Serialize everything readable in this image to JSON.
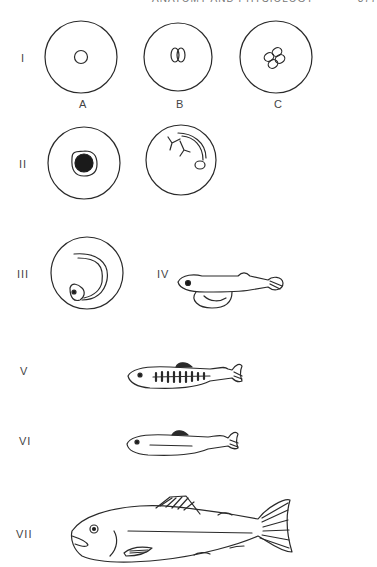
{
  "header": {
    "running_head": "ANATOMY AND PHYSIOLOGY",
    "page_number": "377"
  },
  "figure": {
    "stages": [
      {
        "label": "I",
        "description": "Cleavage stages of egg",
        "panels": [
          "A",
          "B",
          "C"
        ]
      },
      {
        "label": "II",
        "description": "Egg with blastoderm; egg with developing embryo and blood vessels"
      },
      {
        "label": "III",
        "description": "Embryo coiled within egg (eyed egg)"
      },
      {
        "label": "IV",
        "description": "Alevin (sac fry) with yolk sac"
      },
      {
        "label": "V",
        "description": "Fry / parr with parr marks"
      },
      {
        "label": "VI",
        "description": "Smolt"
      },
      {
        "label": "VII",
        "description": "Adult fish"
      }
    ],
    "sub_labels": {
      "a": "A",
      "b": "B",
      "c": "C"
    }
  },
  "colors": {
    "line": "#2a2a2a",
    "text": "#444444",
    "background": "#ffffff"
  }
}
